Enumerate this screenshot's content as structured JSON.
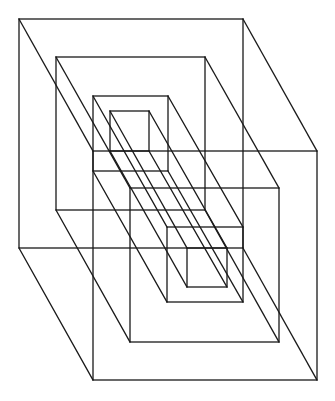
{
  "figure": {
    "type": "nested wireframe boxes (isometric line drawing)",
    "stroke_color": "#1a1a1a",
    "background": "#ffffff",
    "depth_offset": [
      74,
      132
    ],
    "boxes": [
      {
        "name": "outer",
        "front": [
          19,
          19,
          243,
          248
        ],
        "back": [
          93,
          151,
          317,
          380
        ]
      },
      {
        "name": "second",
        "front": [
          56,
          57,
          205,
          210
        ],
        "back": [
          130,
          188,
          279,
          342
        ]
      },
      {
        "name": "third",
        "front": [
          93,
          96,
          168,
          171
        ],
        "back": [
          167,
          227,
          243,
          302
        ]
      },
      {
        "name": "innermost",
        "front": [
          110,
          111,
          149,
          151
        ],
        "back": [
          187,
          248,
          227,
          287
        ]
      }
    ]
  }
}
